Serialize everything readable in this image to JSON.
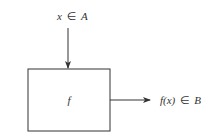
{
  "diagram": {
    "type": "function-block",
    "input_label": {
      "var": "x",
      "rel": "∈",
      "set": "A"
    },
    "box_label": "f",
    "output_label": {
      "var": "f(x)",
      "rel": "∈",
      "set": "B"
    },
    "colors": {
      "stroke": "#333333",
      "background": "#ffffff"
    }
  }
}
